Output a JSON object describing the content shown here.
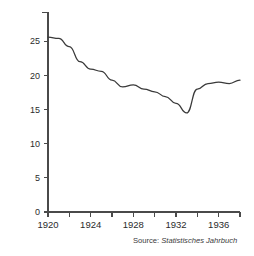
{
  "chart_data": {
    "type": "line",
    "title": "",
    "xlabel": "",
    "ylabel": "Birth rate per 1,000 population",
    "xlim": [
      1920,
      1938
    ],
    "ylim": [
      0,
      27
    ],
    "grid": false,
    "legend": "none",
    "line_color": "#3a3a3a",
    "axis_color": "#4a4a4a",
    "x_major_ticks": [
      1920,
      1924,
      1928,
      1932,
      1936
    ],
    "x_major_tick_labels": [
      "1920",
      "1924",
      "1928",
      "1932",
      "1936"
    ],
    "x_minor_ticks": [
      1922,
      1926,
      1930,
      1934,
      1938
    ],
    "y_ticks": [
      0,
      5,
      10,
      15,
      20,
      25
    ],
    "y_tick_labels": [
      "0",
      "5",
      "10",
      "15",
      "20",
      "25"
    ],
    "x": [
      1920,
      1921,
      1922,
      1923,
      1924,
      1925,
      1926,
      1927,
      1928,
      1929,
      1930,
      1931,
      1932,
      1933,
      1934,
      1935,
      1936,
      1937,
      1938
    ],
    "values": [
      25.6,
      25.4,
      24.2,
      22.0,
      20.9,
      20.6,
      19.3,
      18.3,
      18.6,
      18.0,
      17.6,
      16.9,
      15.9,
      14.5,
      18.0,
      18.8,
      19.0,
      18.8,
      19.3
    ],
    "series": [
      {
        "name": "Birth rate per 1,000 population",
        "values": [
          25.6,
          25.4,
          24.2,
          22.0,
          20.9,
          20.6,
          19.3,
          18.3,
          18.6,
          18.0,
          17.6,
          16.9,
          15.9,
          14.5,
          18.0,
          18.8,
          19.0,
          18.8,
          19.3
        ]
      }
    ]
  },
  "annotations": {
    "source_prefix": "Source:",
    "source_title": "Statistisches Jahrbuch"
  }
}
